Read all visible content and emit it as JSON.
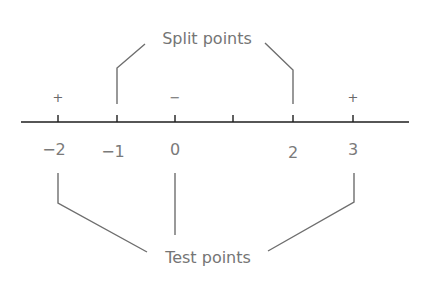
{
  "diagram": {
    "title_top": "Split points",
    "title_bottom": "Test points",
    "axis": {
      "x_start": 21,
      "x_end": 409,
      "y": 122,
      "color": "#1e1e1e"
    },
    "ticks": [
      {
        "value": -2,
        "x": 58,
        "label": "−2",
        "label_dy": 0
      },
      {
        "value": -1,
        "x": 117,
        "label": "−1",
        "label_dy": 2
      },
      {
        "value": 0,
        "x": 175,
        "label": "0",
        "label_dy": 0
      },
      {
        "value": 1,
        "x": 233,
        "label": "",
        "label_dy": 0
      },
      {
        "value": 2,
        "x": 293,
        "label": "2",
        "label_dy": 3
      },
      {
        "value": 3,
        "x": 353,
        "label": "3",
        "label_dy": 0
      }
    ],
    "signs": [
      {
        "text": "+",
        "x": 58
      },
      {
        "text": "−",
        "x": 175
      },
      {
        "text": "+",
        "x": 353
      }
    ],
    "split_points": [
      -1,
      2
    ],
    "test_points": [
      -2,
      0,
      3
    ],
    "text_color": "#757575",
    "leader_color": "#6e6e6e"
  }
}
